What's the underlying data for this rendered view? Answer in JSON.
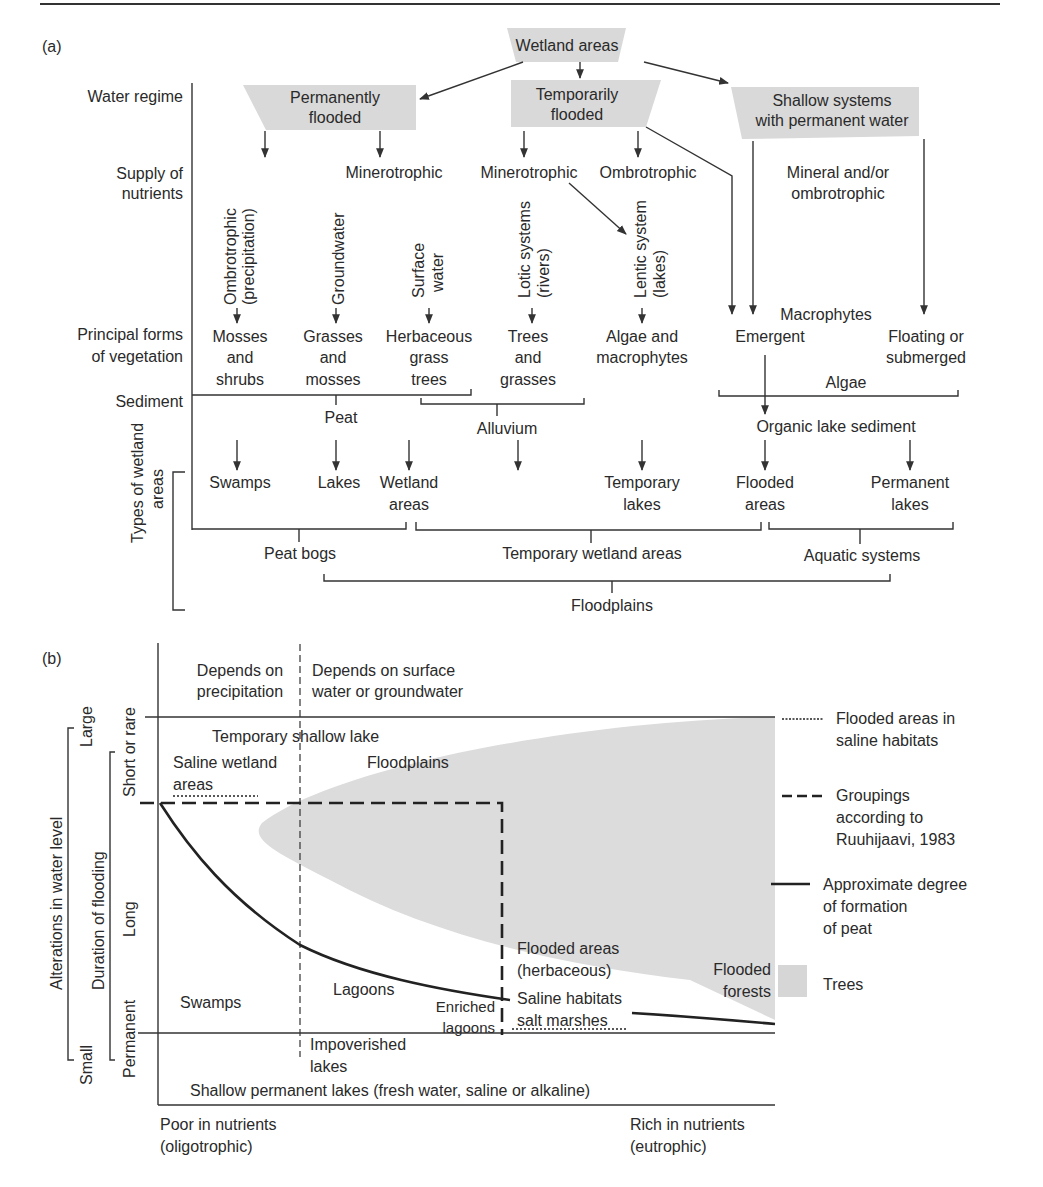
{
  "panel_a": {
    "label": "(a)",
    "root": "Wetland areas",
    "row_labels": {
      "water_regime": "Water regime",
      "supply_1": "Supply of",
      "supply_2": "nutrients",
      "vegetation_1": "Principal forms",
      "vegetation_2": "of vegetation",
      "sediment": "Sediment",
      "types_1": "Types of wetland",
      "types_2": "areas"
    },
    "regimes": {
      "permanent_1": "Permanently",
      "permanent_2": "flooded",
      "temporary_1": "Temporarily",
      "temporary_2": "flooded",
      "shallow_1": "Shallow systems",
      "shallow_2": "with permanent water"
    },
    "nutrients": {
      "minero_1": "Minerotrophic",
      "minero_2": "Minerotrophic",
      "ombro": "Ombrotrophic",
      "mineral_1": "Mineral and/or",
      "mineral_2": "ombrotrophic"
    },
    "sources": {
      "ombro_1": "Ombrotrophic",
      "ombro_2": "(precipitation)",
      "groundwater": "Groundwater",
      "surface_1": "Surface",
      "surface_2": "water",
      "lotic_1": "Lotic systems",
      "lotic_2": "(rivers)",
      "lentic_1": "Lentic system",
      "lentic_2": "(lakes)"
    },
    "vegetation": {
      "mosses_1": "Mosses",
      "mosses_2": "and",
      "mosses_3": "shrubs",
      "grasses_1": "Grasses",
      "grasses_2": "and",
      "grasses_3": "mosses",
      "herb_1": "Herbaceous",
      "herb_2": "grass",
      "herb_3": "trees",
      "trees_1": "Trees",
      "trees_2": "and",
      "trees_3": "grasses",
      "algae_1": "Algae and",
      "algae_2": "macrophytes",
      "macrophytes": "Macrophytes",
      "emergent": "Emergent",
      "floating_1": "Floating or",
      "floating_2": "submerged",
      "algae": "Algae"
    },
    "sediments": {
      "peat": "Peat",
      "alluvium": "Alluvium",
      "organic": "Organic lake sediment"
    },
    "types": {
      "swamps": "Swamps",
      "lakes": "Lakes",
      "wetland_1": "Wetland",
      "wetland_2": "areas",
      "temp_lakes_1": "Temporary",
      "temp_lakes_2": "lakes",
      "flooded_1": "Flooded",
      "flooded_2": "areas",
      "perm_lakes_1": "Permanent",
      "perm_lakes_2": "lakes"
    },
    "groups": {
      "peat_bogs": "Peat bogs",
      "temporary_wetland": "Temporary wetland areas",
      "aquatic": "Aquatic systems",
      "floodplains": "Floodplains"
    }
  },
  "panel_b": {
    "label": "(b)",
    "top_left_1": "Depends on",
    "top_left_2": "precipitation",
    "top_right_1": "Depends on surface",
    "top_right_2": "water or groundwater",
    "y_axis": {
      "outer": "Alterations in water level",
      "outer_large": "Large",
      "outer_small": "Small",
      "middle": "Duration of flooding",
      "short": "Short or rare",
      "long": "Long",
      "permanent": "Permanent"
    },
    "regions": {
      "temp_shallow": "Temporary shallow lake",
      "saline_1": "Saline wetland",
      "saline_2": "areas",
      "floodplains": "Floodplains",
      "swamps": "Swamps",
      "lagoons": "Lagoons",
      "enriched_1": "Enriched",
      "enriched_2": "lagoons",
      "flooded_herb_1": "Flooded areas",
      "flooded_herb_2": "(herbaceous)",
      "saline_hab_1": "Saline habitats",
      "saline_hab_2": "salt marshes",
      "flooded_forests_1": "Flooded",
      "flooded_forests_2": "forests",
      "impoverished_1": "Impoverished",
      "impoverished_2": "lakes",
      "shallow_perm": "Shallow permanent lakes (fresh water, saline or alkaline)"
    },
    "x_axis": {
      "poor_1": "Poor in nutrients",
      "poor_2": "(oligotrophic)",
      "rich_1": "Rich in nutrients",
      "rich_2": "(eutrophic)"
    },
    "legend": [
      {
        "symbol": "dotted-line",
        "line1": "Flooded areas in",
        "line2": "saline habitats"
      },
      {
        "symbol": "dashed-line",
        "line1": "Groupings",
        "line2": "according to",
        "line3": "Ruuhijaavi, 1983"
      },
      {
        "symbol": "solid-line",
        "line1": "Approximate degree",
        "line2": "of formation",
        "line3": "of peat"
      },
      {
        "symbol": "grey-box",
        "line1": "Trees"
      }
    ],
    "colors": {
      "trees_fill": "#dcdcdc",
      "box_fill": "#d9d9d9",
      "line": "#222222"
    }
  }
}
